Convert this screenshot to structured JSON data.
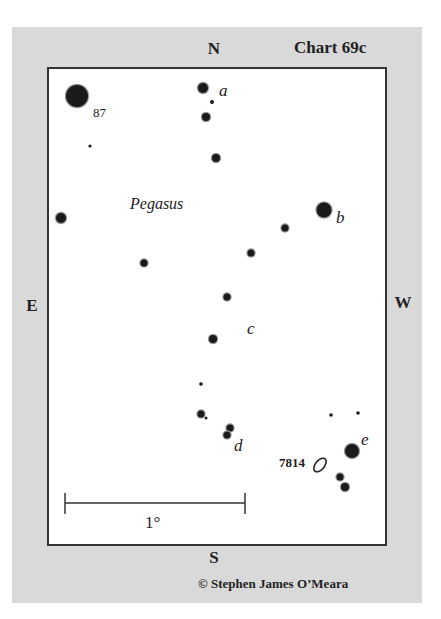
{
  "chart": {
    "title": "Chart 69c",
    "credit": "© Stephen James O’Meara",
    "constellation": "Pegasus",
    "directions": {
      "north": "N",
      "south": "S",
      "east": "E",
      "west": "W"
    },
    "scale_bar": {
      "label": "1°"
    },
    "object": {
      "id": "7814",
      "type": "galaxy"
    },
    "star_labels": {
      "s87": "87",
      "a": "a",
      "b": "b",
      "c": "c",
      "d": "d",
      "e": "e"
    },
    "colors": {
      "panel": "#d9d9d9",
      "chart_bg": "#ffffff",
      "ink": "#222222",
      "border": "#333333"
    }
  },
  "stars": [
    {
      "x": 77,
      "y": 96,
      "r": 11
    },
    {
      "x": 90,
      "y": 146,
      "r": 1.6
    },
    {
      "x": 203,
      "y": 88,
      "r": 5
    },
    {
      "x": 212,
      "y": 102,
      "r": 2
    },
    {
      "x": 206,
      "y": 117,
      "r": 4
    },
    {
      "x": 216,
      "y": 158,
      "r": 4
    },
    {
      "x": 61,
      "y": 218,
      "r": 5
    },
    {
      "x": 324,
      "y": 210,
      "r": 7.5
    },
    {
      "x": 285,
      "y": 228,
      "r": 3.5
    },
    {
      "x": 251,
      "y": 253,
      "r": 3.5
    },
    {
      "x": 144,
      "y": 263,
      "r": 3.5
    },
    {
      "x": 227,
      "y": 297,
      "r": 3.5
    },
    {
      "x": 213,
      "y": 339,
      "r": 4
    },
    {
      "x": 201,
      "y": 384,
      "r": 1.8
    },
    {
      "x": 201,
      "y": 414,
      "r": 3.5
    },
    {
      "x": 206,
      "y": 418,
      "r": 1.5
    },
    {
      "x": 230,
      "y": 428,
      "r": 3.5
    },
    {
      "x": 227,
      "y": 435,
      "r": 3.5
    },
    {
      "x": 331,
      "y": 415,
      "r": 1.8
    },
    {
      "x": 358,
      "y": 413,
      "r": 1.8
    },
    {
      "x": 352,
      "y": 451,
      "r": 7
    },
    {
      "x": 340,
      "y": 477,
      "r": 3.5
    },
    {
      "x": 345,
      "y": 487,
      "r": 4
    }
  ]
}
